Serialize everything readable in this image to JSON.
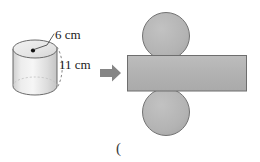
{
  "figure": {
    "background_color": "#ffffff",
    "width": 260,
    "height": 162
  },
  "solid": {
    "name": "cylinder",
    "fill_color": "#e0e0e0",
    "stroke_color": "#555555",
    "top_face_color": "#ebebeb",
    "center_dot_color": "#000000",
    "labels": {
      "diameter": "6 cm",
      "height": "11 cm"
    },
    "leader_lines": {
      "diameter_leader": "solid",
      "height_arc": "dashed"
    }
  },
  "arrow": {
    "name": "transform-arrow",
    "glyph": "➡",
    "color": "#808080",
    "direction": "right"
  },
  "net": {
    "name": "cylinder-net",
    "fill_color": "#b3b3b3",
    "stroke_color": "#6e6e6e",
    "parts": [
      {
        "name": "top-circle",
        "shape": "circle",
        "label": ""
      },
      {
        "name": "lateral-rectangle",
        "shape": "rectangle",
        "label": ""
      },
      {
        "name": "bottom-circle",
        "shape": "circle",
        "label": ""
      }
    ]
  },
  "annotations": {
    "trailing_paren": "("
  }
}
